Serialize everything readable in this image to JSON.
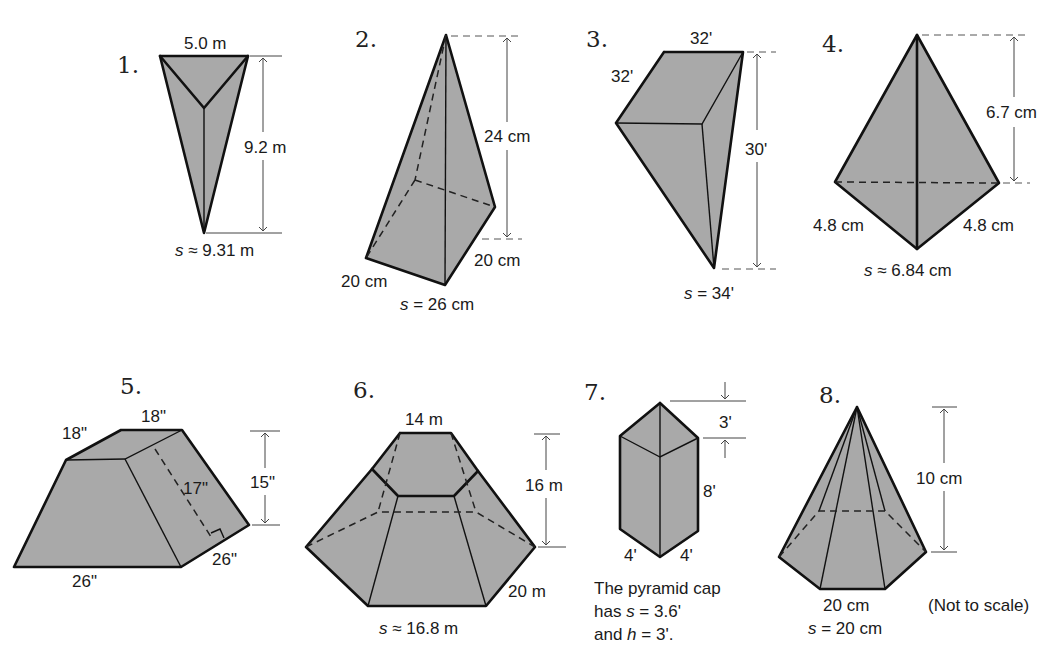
{
  "figures": [
    {
      "number": "1.",
      "shape": "triangular pyramid",
      "labels": {
        "base_edge": "5.0 m",
        "height": "9.2 m",
        "slant": "s ≈ 9.31 m"
      },
      "slant_prefix": "s",
      "slant_rest": " ≈ 9.31 m"
    },
    {
      "number": "2.",
      "shape": "square pyramid",
      "labels": {
        "height": "24 cm",
        "base_left": "20 cm",
        "base_right": "20 cm"
      },
      "slant_prefix": "s",
      "slant_rest": " = 26 cm"
    },
    {
      "number": "3.",
      "shape": "square pyramid (inverted view)",
      "labels": {
        "top_edge": "32'",
        "left_edge": "32'",
        "height": "30'"
      },
      "slant_prefix": "s",
      "slant_rest": " = 34'"
    },
    {
      "number": "4.",
      "shape": "triangular pyramid",
      "labels": {
        "height": "6.7 cm",
        "base_left": "4.8 cm",
        "base_right": "4.8 cm"
      },
      "slant_prefix": "s",
      "slant_rest": " ≈ 6.84 cm"
    },
    {
      "number": "5.",
      "shape": "square frustum",
      "labels": {
        "top_left": "18\"",
        "top_right": "18\"",
        "slant": "17\"",
        "height": "15\"",
        "base_front": "26\"",
        "base_right": "26\""
      }
    },
    {
      "number": "6.",
      "shape": "hexagonal frustum",
      "labels": {
        "top_edge": "14 m",
        "height": "16 m",
        "base_edge": "20 m"
      },
      "slant_prefix": "s",
      "slant_rest": " ≈ 16.8 m"
    },
    {
      "number": "7.",
      "shape": "square prism with pyramid cap",
      "labels": {
        "cap_height": "3'",
        "prism_height": "8'",
        "base_left": "4'",
        "base_right": "4'"
      },
      "note_line1": "The pyramid cap",
      "note_line2_prefix": "has ",
      "note_line2_var": "s",
      "note_line2_rest": " = 3.6'",
      "note_line3_prefix": "and  ",
      "note_line3_var": "h",
      "note_line3_rest": " = 3'."
    },
    {
      "number": "8.",
      "shape": "hexagonal pyramid",
      "labels": {
        "height": "10 cm",
        "base_edge": "20 cm"
      },
      "slant_prefix": "s",
      "slant_rest": " = 20 cm"
    }
  ],
  "footnote": "(Not to scale)"
}
